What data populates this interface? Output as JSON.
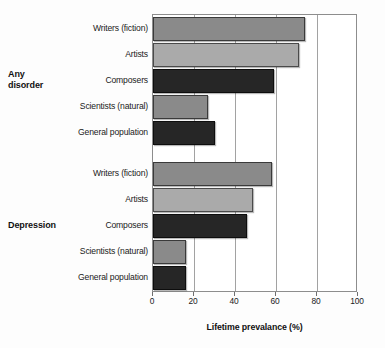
{
  "chart_data": {
    "type": "bar",
    "orientation": "horizontal",
    "title": "",
    "xlabel": "Lifetime prevalance (%)",
    "ylabel": "",
    "xlim": [
      0,
      100
    ],
    "xticks": [
      0,
      20,
      40,
      60,
      80,
      100
    ],
    "xticklabels": [
      "0",
      "20",
      "40",
      "60",
      "80",
      "100"
    ],
    "grid": true,
    "grid_axis": "x",
    "legend": "none",
    "groups": [
      {
        "name": "Any disorder",
        "label_lines": [
          "Any",
          "disorder"
        ],
        "categories": [
          "Writers (fiction)",
          "Artists",
          "Composers",
          "Scientists (natural)",
          "General population"
        ],
        "values": [
          74,
          71,
          59,
          27,
          30
        ],
        "tones": [
          "mid",
          "light",
          "dark",
          "mid",
          "dark"
        ]
      },
      {
        "name": "Depression",
        "label_lines": [
          "Depression"
        ],
        "categories": [
          "Writers (fiction)",
          "Artists",
          "Composers",
          "Scientists (natural)",
          "General population"
        ],
        "values": [
          58,
          49,
          46,
          16,
          16
        ],
        "tones": [
          "mid",
          "light",
          "dark",
          "mid",
          "dark"
        ]
      }
    ],
    "colors": {
      "tone_mid": "#8a8a8a",
      "tone_light": "#aaaaaa",
      "tone_dark": "#262626",
      "axis": "#8d8d8d",
      "gridline": "#a2a2a2",
      "background": "#ffffff",
      "text": "#1a1a1a"
    }
  }
}
